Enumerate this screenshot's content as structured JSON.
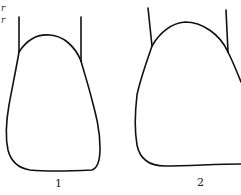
{
  "figure": {
    "partial_text": [
      "r",
      "r"
    ],
    "shapes": [
      {
        "id": "shape-1",
        "label": "1"
      },
      {
        "id": "shape-2",
        "label": "2"
      }
    ],
    "stroke_color": "#111111",
    "background": "#ffffff"
  }
}
